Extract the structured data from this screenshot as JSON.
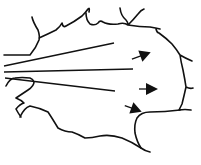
{
  "diagram": {
    "colors": {
      "background": "#ffffff",
      "stroke": "#111111"
    },
    "rays": [
      {
        "name": "ray-top",
        "x1": 4,
        "y1": 66,
        "x2": 114,
        "y2": 43
      },
      {
        "name": "ray-middle",
        "x1": 4,
        "y1": 72,
        "x2": 133,
        "y2": 69
      },
      {
        "name": "ray-bottom",
        "x1": 5,
        "y1": 78,
        "x2": 115,
        "y2": 91
      }
    ],
    "arrows": [
      {
        "name": "arrow-top",
        "x": 146,
        "y": 54,
        "angle": -20
      },
      {
        "name": "arrow-middle",
        "x": 153,
        "y": 89,
        "angle": 0
      },
      {
        "name": "arrow-bottom",
        "x": 137,
        "y": 110,
        "angle": 20
      }
    ]
  }
}
